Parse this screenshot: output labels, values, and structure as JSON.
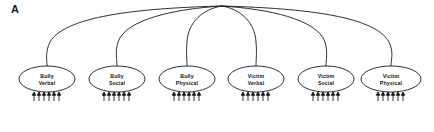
{
  "figure": {
    "panel_label": "A",
    "type": "sem-path-diagram",
    "background_color": "#ffffff",
    "line_color": "#1a1a1a"
  },
  "apex": {
    "x": 222,
    "y": 6,
    "name": "common-convergence-point"
  },
  "nodes": [
    {
      "id": "bully-verbal",
      "line1": "Bully",
      "line2": "Verbal",
      "cx": 47,
      "cy": 79,
      "rx": 28,
      "ry": 13,
      "indicator_count": 6
    },
    {
      "id": "bully-social",
      "line1": "Bully",
      "line2": "Social",
      "cx": 117,
      "cy": 79,
      "rx": 28,
      "ry": 13,
      "indicator_count": 6
    },
    {
      "id": "bully-physical",
      "line1": "Bully",
      "line2": "Physical",
      "cx": 187,
      "cy": 79,
      "rx": 28,
      "ry": 13,
      "indicator_count": 6
    },
    {
      "id": "victim-verbal",
      "line1": "Victim",
      "line2": "Verbal",
      "cx": 256,
      "cy": 79,
      "rx": 28,
      "ry": 13,
      "indicator_count": 6
    },
    {
      "id": "victim-social",
      "line1": "Victim",
      "line2": "Social",
      "cx": 326,
      "cy": 79,
      "rx": 28,
      "ry": 13,
      "indicator_count": 6
    },
    {
      "id": "victim-physical",
      "line1": "Victim",
      "line2": "Physical",
      "cx": 391,
      "cy": 79,
      "rx": 30,
      "ry": 13,
      "indicator_count": 6
    }
  ]
}
